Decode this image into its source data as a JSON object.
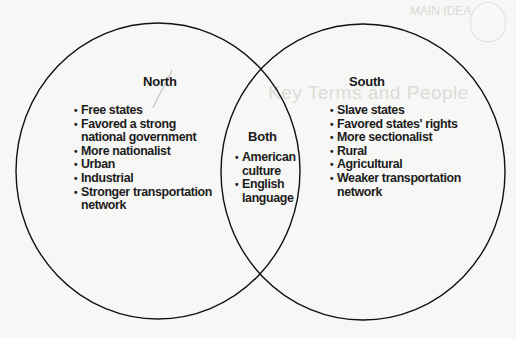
{
  "diagram": {
    "type": "venn",
    "line_color": "#111111",
    "sets": {
      "left": {
        "title": "North",
        "items": [
          "Free states",
          "Favored a strong",
          "national government",
          "More nationalist",
          "Urban",
          "Industrial",
          "Stronger transportation",
          "network"
        ],
        "entries": [
          "Free states",
          "Favored a strong national government",
          "More nationalist",
          "Urban",
          "Industrial",
          "Stronger transportation network"
        ]
      },
      "overlap": {
        "title": "Both",
        "items": [
          "American",
          "culture",
          "English",
          "language"
        ],
        "entries": [
          "American culture",
          "English language"
        ]
      },
      "right": {
        "title": "South",
        "items": [
          "Slave states",
          "Favored states' rights",
          "More sectionalist",
          "Rural",
          "Agricultural",
          "Weaker transportation",
          "network"
        ],
        "entries": [
          "Slave states",
          "Favored states' rights",
          "More sectionalist",
          "Rural",
          "Agricultural",
          "Weaker transportation network"
        ]
      }
    }
  },
  "show_through": {
    "corner_label": "MAIN IDEA",
    "heading": "Key Terms and People"
  }
}
